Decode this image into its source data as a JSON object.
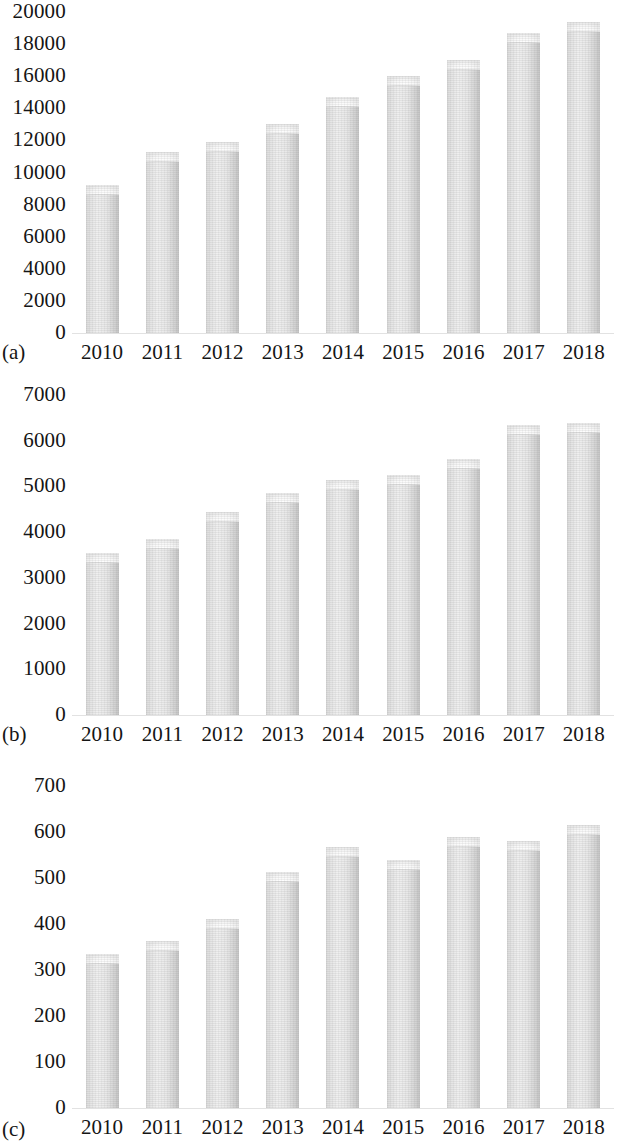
{
  "figure": {
    "background": "#ffffff",
    "bar_fill": "#e3e3e3",
    "bar_edge": "#c3c3c3",
    "text_color": "#151515"
  },
  "chart_data": [
    {
      "type": "bar",
      "panel_tag": "(a)",
      "title": "",
      "xlabel": "",
      "ylabel": "",
      "categories": [
        "2010",
        "2011",
        "2012",
        "2013",
        "2014",
        "2015",
        "2016",
        "2017",
        "2018"
      ],
      "values": [
        9200,
        11300,
        11900,
        13000,
        14700,
        16000,
        17000,
        18700,
        19400
      ],
      "yticks": [
        "0",
        "2000",
        "4000",
        "6000",
        "8000",
        "10000",
        "12000",
        "14000",
        "16000",
        "18000",
        "20000"
      ],
      "ytick_values": [
        0,
        2000,
        4000,
        6000,
        8000,
        10000,
        12000,
        14000,
        16000,
        18000,
        20000
      ],
      "ylim": [
        0,
        20000
      ],
      "grid": false,
      "legend": "none"
    },
    {
      "type": "bar",
      "panel_tag": "(b)",
      "title": "",
      "xlabel": "",
      "ylabel": "",
      "categories": [
        "2010",
        "2011",
        "2012",
        "2013",
        "2014",
        "2015",
        "2016",
        "2017",
        "2018"
      ],
      "values": [
        3550,
        3850,
        4450,
        4850,
        5150,
        5250,
        5600,
        6350,
        6380
      ],
      "yticks": [
        "0",
        "1000",
        "2000",
        "3000",
        "4000",
        "5000",
        "6000",
        "7000"
      ],
      "ytick_values": [
        0,
        1000,
        2000,
        3000,
        4000,
        5000,
        6000,
        7000
      ],
      "ylim": [
        0,
        7000
      ],
      "grid": false,
      "legend": "none"
    },
    {
      "type": "bar",
      "panel_tag": "(c)",
      "title": "",
      "xlabel": "",
      "ylabel": "",
      "categories": [
        "2010",
        "2011",
        "2012",
        "2013",
        "2014",
        "2015",
        "2016",
        "2017",
        "2018"
      ],
      "values": [
        335,
        363,
        410,
        512,
        568,
        540,
        590,
        580,
        615
      ],
      "yticks": [
        "0",
        "100",
        "200",
        "300",
        "400",
        "500",
        "600",
        "700"
      ],
      "ytick_values": [
        0,
        100,
        200,
        300,
        400,
        500,
        600,
        700
      ],
      "ylim": [
        0,
        700
      ],
      "grid": false,
      "legend": "none"
    }
  ]
}
